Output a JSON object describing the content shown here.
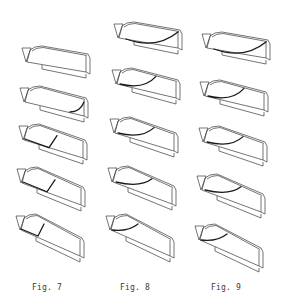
{
  "figure": {
    "colors": {
      "line": "#3a3a3a",
      "curve": "#1a1a1a",
      "background": "#ffffff"
    },
    "columns": [
      {
        "label": "Fig. 7",
        "label_pos": {
          "x": 32,
          "y": 283
        },
        "sketches": [
          {
            "x": 20,
            "y": 44,
            "tilt": 4,
            "curve": "none"
          },
          {
            "x": 18,
            "y": 84,
            "tilt": 8,
            "curve": "tip"
          },
          {
            "x": 17,
            "y": 122,
            "tilt": 12,
            "curve": "kink"
          },
          {
            "x": 15,
            "y": 165,
            "tilt": 16,
            "curve": "kink"
          },
          {
            "x": 14,
            "y": 212,
            "tilt": 20,
            "curve": "kink-deep"
          }
        ]
      },
      {
        "label": "Fig. 8",
        "label_pos": {
          "x": 120,
          "y": 283
        },
        "sketches": [
          {
            "x": 112,
            "y": 20,
            "tilt": 4,
            "curve": "arc-low"
          },
          {
            "x": 110,
            "y": 66,
            "tilt": 8,
            "curve": "arc"
          },
          {
            "x": 108,
            "y": 115,
            "tilt": 12,
            "curve": "arc"
          },
          {
            "x": 106,
            "y": 164,
            "tilt": 16,
            "curve": "arc"
          },
          {
            "x": 104,
            "y": 212,
            "tilt": 20,
            "curve": "arc-short"
          }
        ]
      },
      {
        "label": "Fig. 9",
        "label_pos": {
          "x": 211,
          "y": 283
        },
        "sketches": [
          {
            "x": 200,
            "y": 30,
            "tilt": 4,
            "curve": "arc-low"
          },
          {
            "x": 198,
            "y": 78,
            "tilt": 8,
            "curve": "arc"
          },
          {
            "x": 197,
            "y": 124,
            "tilt": 12,
            "curve": "arc"
          },
          {
            "x": 195,
            "y": 172,
            "tilt": 16,
            "curve": "arc"
          },
          {
            "x": 193,
            "y": 222,
            "tilt": 20,
            "curve": "arc-short"
          }
        ]
      }
    ]
  }
}
